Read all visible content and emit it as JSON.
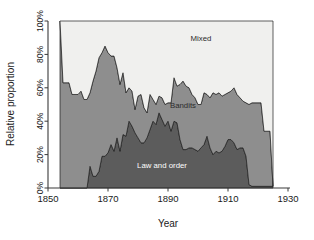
{
  "chart_data": {
    "type": "area",
    "stacked": true,
    "normalized": true,
    "title": "",
    "subtitle": "",
    "xlabel": "Year",
    "ylabel": "Relative proportion",
    "xlim": [
      1850,
      1930
    ],
    "ylim": [
      0,
      100
    ],
    "xticks": [
      1850,
      1870,
      1890,
      1910,
      1930
    ],
    "xtick_labels": [
      "1850",
      "1870",
      "1890",
      "1910",
      "1930"
    ],
    "yticks": [
      0,
      20,
      40,
      60,
      80,
      100
    ],
    "ytick_labels": [
      "0%",
      "20%",
      "40%",
      "60%",
      "80%",
      "100%"
    ],
    "grid": false,
    "legend_position": "inline-annotations",
    "colors": {
      "law_and_order": "#5c5c5c",
      "bandits": "#8e8e8e",
      "mixed": "#f0f0ee",
      "axis": "#3a3a3a",
      "outline": "#1c1c1c",
      "background": "#ffffff"
    },
    "annotations": [
      {
        "text": "Mixed",
        "x": 1901,
        "y": 88
      },
      {
        "text": "Bandits",
        "x": 1895,
        "y": 48
      },
      {
        "text": "Law and order",
        "x": 1888,
        "y": 12
      }
    ],
    "x": [
      1854,
      1855,
      1856,
      1857,
      1858,
      1859,
      1860,
      1861,
      1862,
      1863,
      1864,
      1865,
      1866,
      1867,
      1868,
      1869,
      1870,
      1871,
      1872,
      1873,
      1874,
      1875,
      1876,
      1877,
      1878,
      1879,
      1880,
      1881,
      1882,
      1883,
      1884,
      1885,
      1886,
      1887,
      1888,
      1889,
      1890,
      1891,
      1892,
      1893,
      1894,
      1895,
      1896,
      1897,
      1898,
      1899,
      1900,
      1901,
      1902,
      1903,
      1904,
      1905,
      1906,
      1907,
      1908,
      1909,
      1910,
      1911,
      1912,
      1913,
      1914,
      1915,
      1916,
      1917,
      1918,
      1919,
      1920,
      1921,
      1922,
      1923,
      1924,
      1925
    ],
    "series": [
      {
        "name": "Law and order",
        "color": "#5c5c5c",
        "values": [
          0,
          0,
          0,
          0,
          0,
          0,
          0,
          0,
          0,
          0,
          13,
          7,
          7,
          10,
          19,
          19,
          21,
          26,
          22,
          30,
          22,
          32,
          31,
          40,
          37,
          33,
          30,
          27,
          27,
          30,
          35,
          40,
          38,
          45,
          41,
          37,
          40,
          34,
          40,
          39,
          29,
          23,
          23,
          24,
          24,
          23,
          22,
          24,
          26,
          31,
          24,
          20,
          22,
          21,
          22,
          25,
          29,
          29,
          27,
          23,
          24,
          24,
          19,
          2,
          1,
          1,
          1,
          1,
          1,
          1,
          1,
          1
        ]
      },
      {
        "name": "Bandits",
        "color": "#8e8e8e",
        "values": [
          100,
          63,
          63,
          63,
          56,
          56,
          56,
          58,
          53,
          53,
          44,
          57,
          63,
          68,
          62,
          66,
          60,
          53,
          57,
          42,
          40,
          37,
          26,
          20,
          21,
          14,
          25,
          29,
          21,
          15,
          21,
          13,
          12,
          10,
          13,
          13,
          11,
          17,
          26,
          22,
          33,
          41,
          38,
          36,
          32,
          31,
          28,
          26,
          31,
          25,
          30,
          37,
          34,
          36,
          33,
          31,
          28,
          29,
          33,
          33,
          30,
          28,
          32,
          48,
          50,
          50,
          50,
          50,
          33,
          33,
          33,
          0
        ]
      },
      {
        "name": "Mixed",
        "color": "#f0f0ee",
        "values": [
          0,
          37,
          37,
          37,
          44,
          44,
          44,
          42,
          47,
          47,
          43,
          36,
          30,
          22,
          19,
          15,
          19,
          21,
          21,
          28,
          38,
          31,
          43,
          40,
          42,
          53,
          45,
          44,
          52,
          55,
          44,
          47,
          50,
          45,
          46,
          50,
          49,
          49,
          34,
          39,
          38,
          36,
          39,
          40,
          44,
          46,
          50,
          50,
          43,
          44,
          46,
          43,
          44,
          43,
          45,
          44,
          43,
          42,
          40,
          44,
          46,
          48,
          49,
          50,
          49,
          49,
          49,
          49,
          66,
          66,
          66,
          99
        ]
      }
    ]
  },
  "axes": {
    "ylabel": "Relative proportion",
    "xlabel": "Year"
  }
}
